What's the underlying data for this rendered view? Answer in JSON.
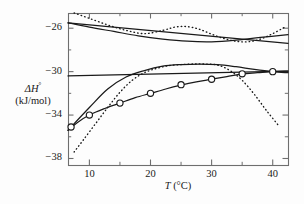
{
  "chart_data": {
    "type": "line",
    "title": "",
    "xlabel": "T (°C)",
    "xlabel_symbol": "T",
    "xlabel_unit": "(°C)",
    "ylabel": "ΔH° (kJ/mol)",
    "ylabel_line1": "ΔH",
    "ylabel_line1_sup": "°",
    "ylabel_line2": "(kJ/mol)",
    "xlim": [
      6.5,
      42.5
    ],
    "ylim": [
      -38.6,
      -24.6
    ],
    "xticks": [
      10,
      20,
      30,
      40
    ],
    "xtick_labels": [
      "10",
      "20",
      "30",
      "40"
    ],
    "xminorticks": [
      15,
      25,
      35
    ],
    "yticks": [
      -26,
      -30,
      -34,
      -38
    ],
    "ytick_labels": [
      "−26",
      "−30",
      "−34",
      "−38"
    ],
    "yminorticks": [
      -28,
      -32,
      -36
    ],
    "grid": false,
    "legend": "none",
    "axis_color": "#6e6e6e",
    "line_color": "#1a1a1a",
    "marker_style": "open-circle",
    "series": [
      {
        "name": "experimental-data-points",
        "style": "open-circle-markers",
        "x": [
          7,
          10,
          15,
          20,
          25,
          30,
          35,
          40
        ],
        "y": [
          -35.1,
          -34.0,
          -32.9,
          -32.0,
          -31.2,
          -30.7,
          -30.2,
          -30.0
        ]
      },
      {
        "name": "fit-through-data",
        "style": "solid-curve",
        "x": [
          6.5,
          8,
          10,
          12.5,
          15,
          17.5,
          20,
          22.5,
          25,
          27.5,
          30,
          32.5,
          35,
          37.5,
          40,
          42.5
        ],
        "y": [
          -35.4,
          -34.7,
          -34.0,
          -33.4,
          -32.9,
          -32.4,
          -32.0,
          -31.6,
          -31.25,
          -30.95,
          -30.7,
          -30.45,
          -30.2,
          -30.1,
          -30.0,
          -29.95
        ]
      },
      {
        "name": "upper-solid-straight-line",
        "style": "solid-line",
        "x": [
          6.5,
          42.5
        ],
        "y": [
          -25.5,
          -27.4
        ]
      },
      {
        "name": "middle-solid-straight-line",
        "style": "solid-line",
        "x": [
          6.5,
          42.5
        ],
        "y": [
          -30.4,
          -29.95
        ]
      },
      {
        "name": "middle-solid-curve",
        "style": "solid-curve",
        "x": [
          6.5,
          10,
          13,
          16,
          19,
          22,
          25,
          28,
          31,
          34,
          37,
          40,
          42.5
        ],
        "y": [
          -35.4,
          -33.3,
          -31.6,
          -30.5,
          -29.9,
          -29.5,
          -29.35,
          -29.3,
          -29.35,
          -29.55,
          -29.8,
          -30.0,
          -30.1
        ]
      },
      {
        "name": "upper-solid-shallow-curve",
        "style": "solid-curve",
        "x": [
          6.5,
          10,
          14,
          18,
          22,
          26,
          30,
          34,
          38,
          42.5
        ],
        "y": [
          -25.5,
          -25.9,
          -26.3,
          -26.7,
          -27.0,
          -27.2,
          -27.25,
          -27.1,
          -26.85,
          -26.6
        ]
      },
      {
        "name": "upper-dotted-curve",
        "style": "dotted-curve",
        "x": [
          7.5,
          10,
          13,
          16,
          19,
          22,
          24,
          26,
          28,
          30,
          32,
          34,
          36,
          38,
          40,
          42
        ],
        "y": [
          -24.6,
          -25.1,
          -25.7,
          -26.2,
          -26.5,
          -26.2,
          -25.9,
          -25.85,
          -26.1,
          -26.55,
          -26.95,
          -27.2,
          -27.25,
          -27.0,
          -26.5,
          -25.9
        ]
      },
      {
        "name": "lower-dotted-curve",
        "style": "dotted-curve",
        "x": [
          7.5,
          9,
          11,
          13,
          15,
          17,
          19,
          21,
          23,
          25,
          27,
          29,
          31,
          33,
          35,
          37,
          39,
          41
        ],
        "y": [
          -37.4,
          -36.3,
          -34.8,
          -33.3,
          -31.9,
          -30.8,
          -30.1,
          -29.7,
          -29.45,
          -29.35,
          -29.3,
          -29.3,
          -29.4,
          -29.9,
          -30.8,
          -32.1,
          -33.6,
          -35.0
        ]
      }
    ]
  },
  "plot_area": {
    "left": 68,
    "top": 13,
    "right": 288,
    "bottom": 165
  }
}
